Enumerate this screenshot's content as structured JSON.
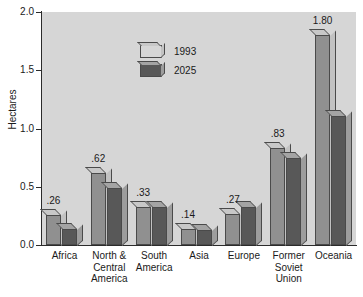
{
  "chart_data": {
    "type": "bar",
    "title": "",
    "xlabel": "",
    "ylabel": "Hectares",
    "ylim": [
      0.0,
      2.0
    ],
    "yticks": [
      "0.0",
      "0.5",
      "1.0",
      "1.5",
      "2.0"
    ],
    "ytick_values": [
      0.0,
      0.5,
      1.0,
      1.5,
      2.0
    ],
    "grid": false,
    "legend_position": "upper-left-inside",
    "categories": [
      "Africa",
      "North &\nCentral\nAmerica",
      "South\nAmerica",
      "Asia",
      "Europe",
      "Former\nSoviet\nUnion",
      "Oceania"
    ],
    "series": [
      {
        "name": "1993",
        "color": "#909090",
        "values": [
          0.26,
          0.62,
          0.33,
          0.14,
          0.27,
          0.83,
          1.8
        ],
        "labels": [
          ".26",
          ".62",
          ".33",
          ".14",
          ".27",
          ".83",
          "1.80"
        ]
      },
      {
        "name": "2025",
        "color": "#585858",
        "values": [
          0.14,
          0.49,
          0.33,
          0.13,
          0.33,
          0.75,
          1.11
        ],
        "labels": [
          "",
          "",
          "",
          "",
          "",
          "",
          ""
        ]
      }
    ]
  },
  "legend": {
    "items": [
      {
        "label": "1993"
      },
      {
        "label": "2025"
      }
    ]
  },
  "colors": {
    "plot_background": "#d6d6d6",
    "page_background": "#ffffff",
    "series_1993": "#909090",
    "series_2025": "#585858",
    "axis": "#2b2b2b",
    "text": "#1a1a1a"
  }
}
